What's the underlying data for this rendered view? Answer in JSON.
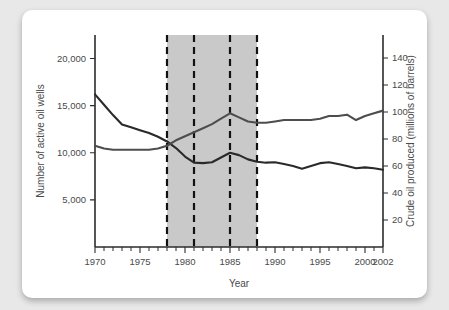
{
  "chart_data": {
    "type": "line",
    "title": "",
    "xlabel": "Year",
    "ylabel": "Number of active oil wells",
    "y2label": "Crude oil produced (millions of barrels)",
    "xlim": [
      1970,
      2002
    ],
    "ylim": [
      0,
      22500
    ],
    "y2lim": [
      0,
      157
    ],
    "grid": false,
    "legend": "none",
    "xticks": [
      1970,
      1975,
      1980,
      1985,
      1990,
      1995,
      2000,
      2002
    ],
    "xticklabels": [
      "1970",
      "1975",
      "1980",
      "1985",
      "1990",
      "1995",
      "2000",
      "2002"
    ],
    "yticks": [
      5000,
      10000,
      15000,
      20000
    ],
    "yticklabels": [
      "5,000",
      "10,000",
      "15,000",
      "20,000"
    ],
    "y2ticks": [
      20,
      40,
      60,
      80,
      100,
      120,
      140
    ],
    "y2ticklabels": [
      "20",
      "40",
      "60",
      "80",
      "100",
      "120",
      "140"
    ],
    "shaded_band": {
      "start": 1978,
      "end": 1988,
      "color": "#c9c9c9"
    },
    "event_lines": [
      1978,
      1981,
      1985,
      1988
    ],
    "series": [
      {
        "name": "Number of active oil wells",
        "axis": "left",
        "color": "#2a2a2a",
        "x": [
          1970,
          1971,
          1972,
          1973,
          1974,
          1975,
          1976,
          1977,
          1978,
          1979,
          1980,
          1981,
          1982,
          1983,
          1984,
          1985,
          1986,
          1987,
          1988,
          1989,
          1990,
          1991,
          1992,
          1993,
          1994,
          1995,
          1996,
          1997,
          1998,
          1999,
          2000,
          2001,
          2002
        ],
        "values": [
          16200,
          15100,
          14000,
          13000,
          12700,
          12400,
          12100,
          11700,
          11200,
          10500,
          9600,
          8950,
          8900,
          9000,
          9500,
          10000,
          9750,
          9300,
          9050,
          8950,
          9000,
          8800,
          8600,
          8300,
          8600,
          8900,
          9000,
          8800,
          8600,
          8350,
          8450,
          8350,
          8200
        ]
      },
      {
        "name": "Crude oil produced (millions of barrels)",
        "axis": "right",
        "color": "#4d4d4d",
        "x": [
          1970,
          1971,
          1972,
          1973,
          1974,
          1975,
          1976,
          1977,
          1978,
          1979,
          1980,
          1981,
          1982,
          1983,
          1984,
          1985,
          1986,
          1987,
          1988,
          1989,
          1990,
          1991,
          1992,
          1993,
          1994,
          1995,
          1996,
          1997,
          1998,
          1999,
          2000,
          2001,
          2002
        ],
        "values": [
          75,
          73,
          72,
          72,
          72,
          72,
          72,
          73,
          75,
          79,
          82,
          85,
          88,
          91,
          95,
          99,
          96,
          93,
          92,
          92,
          93,
          94,
          94,
          94,
          94,
          95,
          97,
          97,
          98,
          94,
          97,
          99,
          101
        ]
      }
    ]
  },
  "labels": {
    "y_axis_title": "Number of active oil wells",
    "y2_axis_title": "Crude oil produced (millions of barrels)",
    "x_axis_title": "Year"
  }
}
